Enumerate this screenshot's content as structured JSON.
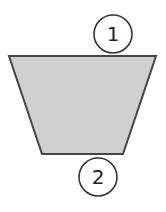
{
  "diagram": {
    "shape": {
      "type": "trapezoid",
      "fill": "#d0d0d0",
      "stroke": "#444444",
      "points": [
        [
          9,
          56
        ],
        [
          156,
          56
        ],
        [
          123,
          154
        ],
        [
          42,
          154
        ]
      ]
    },
    "labels": [
      {
        "id": "label-1",
        "text": "1",
        "cx": 113,
        "cy": 34,
        "r": 19,
        "position": "top edge"
      },
      {
        "id": "label-2",
        "text": "2",
        "cx": 98,
        "cy": 177,
        "r": 19,
        "position": "bottom edge"
      }
    ],
    "colors": {
      "background": "#ffffff",
      "circle_stroke": "#333333",
      "text": "#222222"
    }
  }
}
